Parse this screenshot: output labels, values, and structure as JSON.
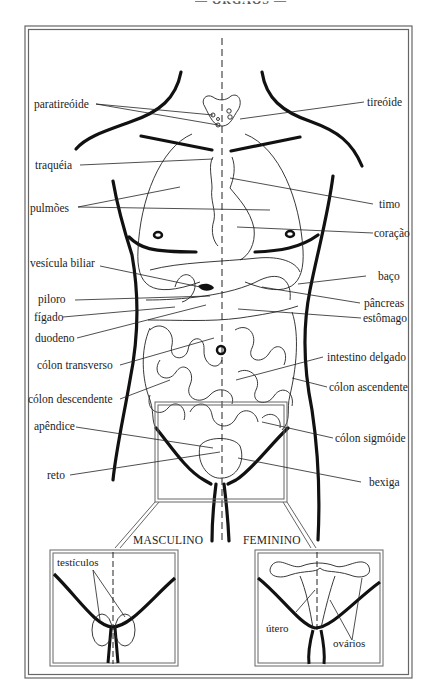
{
  "diagram": {
    "header_fragment": "— ÓRGÃOS —",
    "colors": {
      "ink": "#1a1a1a",
      "frame": "#555555",
      "paper": "#ffffff"
    },
    "labels_left": {
      "paratireoide": "paratireóide",
      "traqueia": "traquéia",
      "pulmoes": "pulmões",
      "vesicula_biliar": "vesícula biliar",
      "piloro": "piloro",
      "figado": "fígado",
      "duodeno": "duodeno",
      "colon_transverso": "cólon transverso",
      "colon_descendente": "cólon descendente",
      "apendice": "apêndice",
      "reto": "reto"
    },
    "labels_right": {
      "tireoide": "tireóide",
      "timo": "timo",
      "coracao": "coração",
      "baco": "baço",
      "pancreas": "pâncreas",
      "estomago": "estômago",
      "intestino_delgado": "intestino delgado",
      "colon_ascendente": "cólon ascendente",
      "colon_sigmoide": "cólon sigmóide",
      "bexiga": "bexiga"
    },
    "insets": {
      "male": {
        "title": "MASCULINO",
        "labels": {
          "testiculos": "testículos"
        }
      },
      "female": {
        "title": "FEMININO",
        "labels": {
          "utero": "útero",
          "ovarios": "ovários"
        }
      }
    }
  }
}
